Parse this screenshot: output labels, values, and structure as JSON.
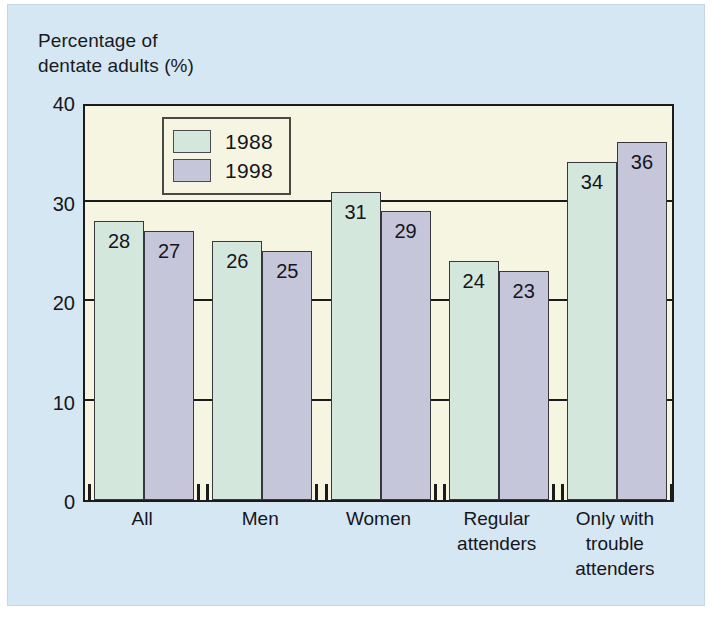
{
  "figure": {
    "background_color": "#d5e7f2",
    "plot_background_color": "#f6f5e2",
    "axis_title": "Percentage of\ndentate adults (%)"
  },
  "legend": {
    "entries": [
      {
        "label": "1988",
        "color": "#d4e7dc"
      },
      {
        "label": "1998",
        "color": "#c6c6da"
      }
    ]
  },
  "chart_data": {
    "type": "bar",
    "title": "",
    "xlabel": "",
    "ylabel": "Percentage of dentate adults (%)",
    "ylim": [
      0,
      40
    ],
    "yticks": [
      0,
      10,
      20,
      30,
      40
    ],
    "ytick_labels": [
      "0",
      "10",
      "20",
      "30",
      "40"
    ],
    "grid": true,
    "legend_position": "upper-left-inside",
    "categories": [
      "All",
      "Men",
      "Women",
      "Regular\nattenders",
      "Only with\ntrouble\nattenders"
    ],
    "series": [
      {
        "name": "1988",
        "color": "#d4e7dc",
        "values": [
          28,
          26,
          31,
          24,
          34
        ]
      },
      {
        "name": "1998",
        "color": "#c6c6da",
        "values": [
          27,
          25,
          29,
          23,
          36
        ]
      }
    ],
    "value_labels": {
      "1988": [
        "28",
        "26",
        "31",
        "24",
        "34"
      ],
      "1998": [
        "27",
        "25",
        "29",
        "23",
        "36"
      ]
    }
  }
}
